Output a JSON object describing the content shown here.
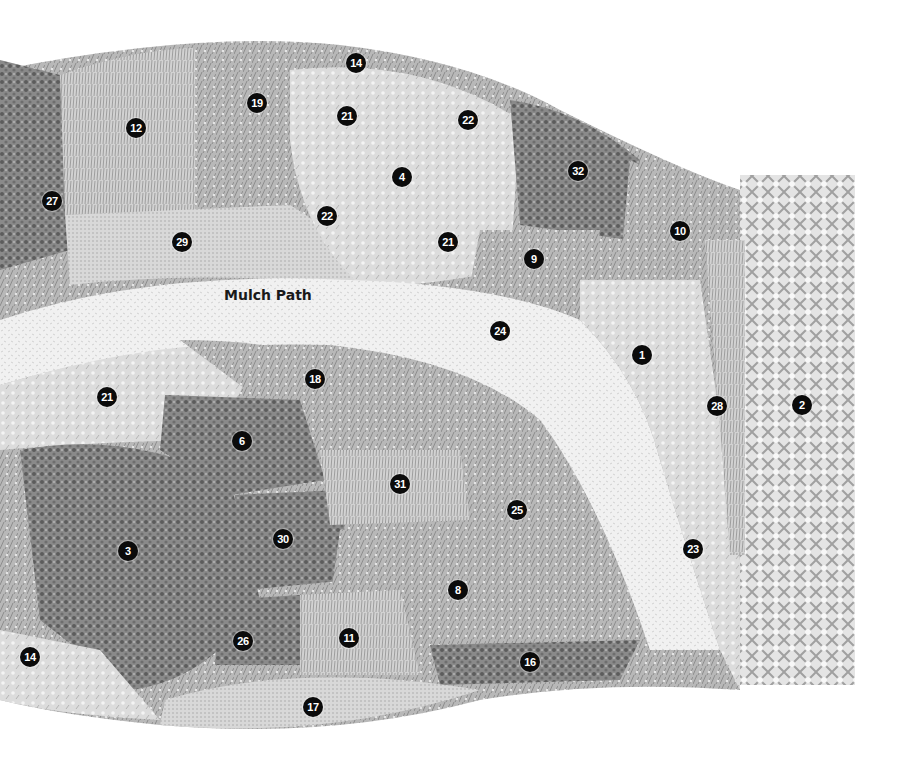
{
  "path_label": "Mulch Path",
  "colors": {
    "background": "#ffffff",
    "marker_fill": "#0b0b0b",
    "marker_text": "#ffffff",
    "foliage_dark": "#6a6a6a",
    "foliage_mid": "#9a9a9a",
    "foliage_light": "#c8c8c8",
    "mulch": "#e8e8e8"
  },
  "markers": [
    {
      "id": "m1",
      "label": "1",
      "x": 642,
      "y": 355
    },
    {
      "id": "m2",
      "label": "2",
      "x": 802,
      "y": 405
    },
    {
      "id": "m3",
      "label": "3",
      "x": 128,
      "y": 551
    },
    {
      "id": "m4",
      "label": "4",
      "x": 402,
      "y": 177
    },
    {
      "id": "m6",
      "label": "6",
      "x": 242,
      "y": 441
    },
    {
      "id": "m8",
      "label": "8",
      "x": 458,
      "y": 590
    },
    {
      "id": "m9",
      "label": "9",
      "x": 534,
      "y": 259
    },
    {
      "id": "m10",
      "label": "10",
      "x": 680,
      "y": 231
    },
    {
      "id": "m11",
      "label": "11",
      "x": 349,
      "y": 638
    },
    {
      "id": "m12",
      "label": "12",
      "x": 136,
      "y": 128
    },
    {
      "id": "m14a",
      "label": "14",
      "x": 356,
      "y": 63
    },
    {
      "id": "m14b",
      "label": "14",
      "x": 30,
      "y": 657
    },
    {
      "id": "m16",
      "label": "16",
      "x": 530,
      "y": 662
    },
    {
      "id": "m17",
      "label": "17",
      "x": 313,
      "y": 707
    },
    {
      "id": "m18",
      "label": "18",
      "x": 315,
      "y": 379
    },
    {
      "id": "m19",
      "label": "19",
      "x": 257,
      "y": 103
    },
    {
      "id": "m21a",
      "label": "21",
      "x": 347,
      "y": 116
    },
    {
      "id": "m21b",
      "label": "21",
      "x": 448,
      "y": 242
    },
    {
      "id": "m21c",
      "label": "21",
      "x": 107,
      "y": 397
    },
    {
      "id": "m22a",
      "label": "22",
      "x": 468,
      "y": 120
    },
    {
      "id": "m22b",
      "label": "22",
      "x": 327,
      "y": 216
    },
    {
      "id": "m23",
      "label": "23",
      "x": 693,
      "y": 549
    },
    {
      "id": "m24",
      "label": "24",
      "x": 500,
      "y": 331
    },
    {
      "id": "m25",
      "label": "25",
      "x": 517,
      "y": 510
    },
    {
      "id": "m26",
      "label": "26",
      "x": 243,
      "y": 641
    },
    {
      "id": "m27",
      "label": "27",
      "x": 52,
      "y": 201
    },
    {
      "id": "m28",
      "label": "28",
      "x": 717,
      "y": 406
    },
    {
      "id": "m29",
      "label": "29",
      "x": 182,
      "y": 242
    },
    {
      "id": "m30",
      "label": "30",
      "x": 283,
      "y": 539
    },
    {
      "id": "m31",
      "label": "31",
      "x": 400,
      "y": 484
    },
    {
      "id": "m32",
      "label": "32",
      "x": 578,
      "y": 171
    }
  ]
}
